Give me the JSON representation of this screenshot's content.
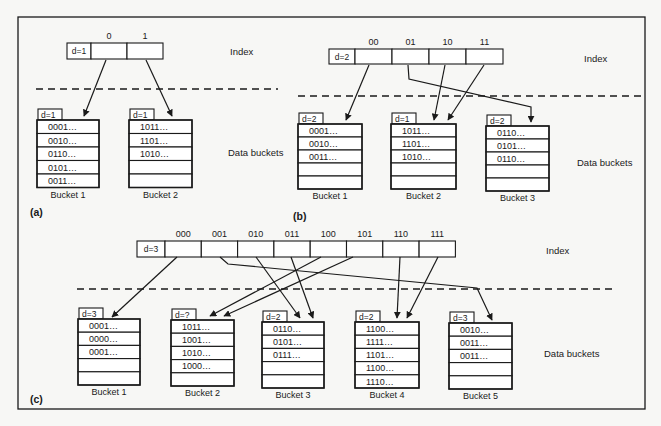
{
  "colors": {
    "ink": "#1a1a1a",
    "paper": "#f7f7f5",
    "cell": "#ffffff"
  },
  "side_labels": {
    "index": "Index",
    "data_buckets": "Data buckets"
  },
  "panels": [
    {
      "id": "a",
      "label": "(a)",
      "global_depth_label": "d=1",
      "index": {
        "x": 67,
        "y": 43,
        "depth_w": 24,
        "cell_w": 36,
        "h": 16,
        "headers": [
          "0",
          "1"
        ]
      },
      "side": {
        "index_x": 230,
        "index_y": 55,
        "data_x": 228,
        "data_y": 156
      },
      "divider": {
        "x1": 36,
        "x2": 278,
        "y": 89
      },
      "label_pos": {
        "x": 30,
        "y": 216
      },
      "buckets": [
        {
          "name": "Bucket 1",
          "local_depth_label": "d=1",
          "x": 37,
          "y": 120,
          "w": 62,
          "row_h": 13.5,
          "rows": [
            "0001…",
            "0010…",
            "0110…",
            "0101…",
            "0011…"
          ]
        },
        {
          "name": "Bucket 2",
          "local_depth_label": "d=1",
          "x": 129,
          "y": 120,
          "w": 63,
          "row_h": 13.5,
          "rows": [
            "1011…",
            "1101…",
            "1010…",
            "",
            ""
          ]
        }
      ],
      "pointers": [
        {
          "from_slot": "0",
          "to_bucket": "Bucket 1",
          "path": [
            [
              106,
              60
            ],
            [
              84,
              116
            ]
          ]
        },
        {
          "from_slot": "1",
          "to_bucket": "Bucket 2",
          "path": [
            [
              146,
              60
            ],
            [
              172,
              116
            ]
          ]
        }
      ]
    },
    {
      "id": "b",
      "label": "(b)",
      "global_depth_label": "d=2",
      "index": {
        "x": 329,
        "y": 49,
        "depth_w": 26,
        "cell_w": 37,
        "h": 15,
        "headers": [
          "00",
          "01",
          "10",
          "11"
        ]
      },
      "side": {
        "index_x": 584,
        "index_y": 62,
        "data_x": 577,
        "data_y": 166
      },
      "divider": {
        "x1": 298,
        "x2": 643,
        "y": 96
      },
      "label_pos": {
        "x": 293,
        "y": 220
      },
      "buckets": [
        {
          "name": "Bucket 1",
          "local_depth_label": "d=2",
          "x": 298,
          "y": 124,
          "w": 64,
          "row_h": 13,
          "rows": [
            "0001…",
            "0010…",
            "0011…",
            "",
            ""
          ]
        },
        {
          "name": "Bucket 2",
          "local_depth_label": "d=1",
          "x": 391,
          "y": 124,
          "w": 65,
          "row_h": 13,
          "rows": [
            "1011…",
            "1101…",
            "1010…",
            "",
            ""
          ]
        },
        {
          "name": "Bucket 3",
          "local_depth_label": "d=2",
          "x": 486,
          "y": 126,
          "w": 63,
          "row_h": 13,
          "rows": [
            "0110…",
            "0101…",
            "0110…",
            "",
            ""
          ]
        }
      ],
      "pointers": [
        {
          "from_slot": "00",
          "to_bucket": "Bucket 1",
          "path": [
            [
              369,
              65
            ],
            [
              346,
              120
            ]
          ]
        },
        {
          "from_slot": "01",
          "to_bucket": "Bucket 3",
          "path": [
            [
              408,
              65
            ],
            [
              409,
              79
            ],
            [
              531,
              107
            ],
            [
              531,
              122
            ]
          ]
        },
        {
          "from_slot": "10",
          "to_bucket": "Bucket 2",
          "path": [
            [
              445,
              65
            ],
            [
              434,
              120
            ]
          ]
        },
        {
          "from_slot": "11",
          "to_bucket": "Bucket 2",
          "path": [
            [
              484,
              65
            ],
            [
              448,
              120
            ]
          ]
        }
      ]
    },
    {
      "id": "c",
      "label": "(c)",
      "global_depth_label": "d=3",
      "index": {
        "x": 137,
        "y": 241,
        "depth_w": 28,
        "cell_w": 36.3,
        "h": 16,
        "headers": [
          "000",
          "001",
          "010",
          "011",
          "100",
          "101",
          "110",
          "111"
        ]
      },
      "side": {
        "index_x": 546,
        "index_y": 254,
        "data_x": 544,
        "data_y": 357
      },
      "divider": {
        "x1": 77,
        "x2": 614,
        "y": 289
      },
      "label_pos": {
        "x": 30,
        "y": 403
      },
      "buckets": [
        {
          "name": "Bucket 1",
          "local_depth_label": "d=3",
          "x": 78,
          "y": 319,
          "w": 62,
          "row_h": 13.2,
          "rows": [
            "0001…",
            "0000…",
            "0001…",
            "",
            ""
          ]
        },
        {
          "name": "Bucket 2",
          "local_depth_label": "d=?",
          "x": 171,
          "y": 320,
          "w": 63,
          "row_h": 13.2,
          "rows": [
            "1011…",
            "1001…",
            "1010…",
            "1000…",
            ""
          ]
        },
        {
          "name": "Bucket 3",
          "local_depth_label": "d=2",
          "x": 262,
          "y": 322,
          "w": 62,
          "row_h": 13.2,
          "rows": [
            "0110…",
            "0101…",
            "0111…",
            "",
            ""
          ]
        },
        {
          "name": "Bucket 4",
          "local_depth_label": "d=2",
          "x": 355,
          "y": 322,
          "w": 64,
          "row_h": 13.2,
          "rows": [
            "1100…",
            "1111…",
            "1101…",
            "1100…",
            "1110…"
          ]
        },
        {
          "name": "Bucket 5",
          "local_depth_label": "d=3",
          "x": 449,
          "y": 323,
          "w": 63,
          "row_h": 13.2,
          "rows": [
            "0010…",
            "0011…",
            "0011…",
            "",
            ""
          ]
        }
      ],
      "pointers": [
        {
          "from_slot": "000",
          "to_bucket": "Bucket 1",
          "path": [
            [
              177,
              257
            ],
            [
              112,
              317
            ]
          ]
        },
        {
          "from_slot": "001",
          "to_bucket": "Bucket 5",
          "path": [
            [
              220,
              257
            ],
            [
              228,
              264
            ],
            [
              477,
              288
            ],
            [
              492,
              320
            ]
          ]
        },
        {
          "from_slot": "010",
          "to_bucket": "Bucket 3",
          "path": [
            [
              256,
              257
            ],
            [
              300,
              318
            ]
          ]
        },
        {
          "from_slot": "011",
          "to_bucket": "Bucket 3",
          "path": [
            [
              291,
              257
            ],
            [
              313,
              318
            ]
          ]
        },
        {
          "from_slot": "100",
          "to_bucket": "Bucket 2",
          "path": [
            [
              321,
              257
            ],
            [
              210,
              316
            ]
          ]
        },
        {
          "from_slot": "101",
          "to_bucket": "Bucket 2",
          "path": [
            [
              353,
              257
            ],
            [
              224,
              316
            ]
          ]
        },
        {
          "from_slot": "110",
          "to_bucket": "Bucket 4",
          "path": [
            [
              400,
              257
            ],
            [
              397,
              318
            ]
          ]
        },
        {
          "from_slot": "111",
          "to_bucket": "Bucket 4",
          "path": [
            [
              438,
              257
            ],
            [
              407,
              318
            ]
          ]
        }
      ]
    }
  ],
  "frame": {
    "x": 18,
    "y": 17,
    "w": 627,
    "h": 392
  }
}
